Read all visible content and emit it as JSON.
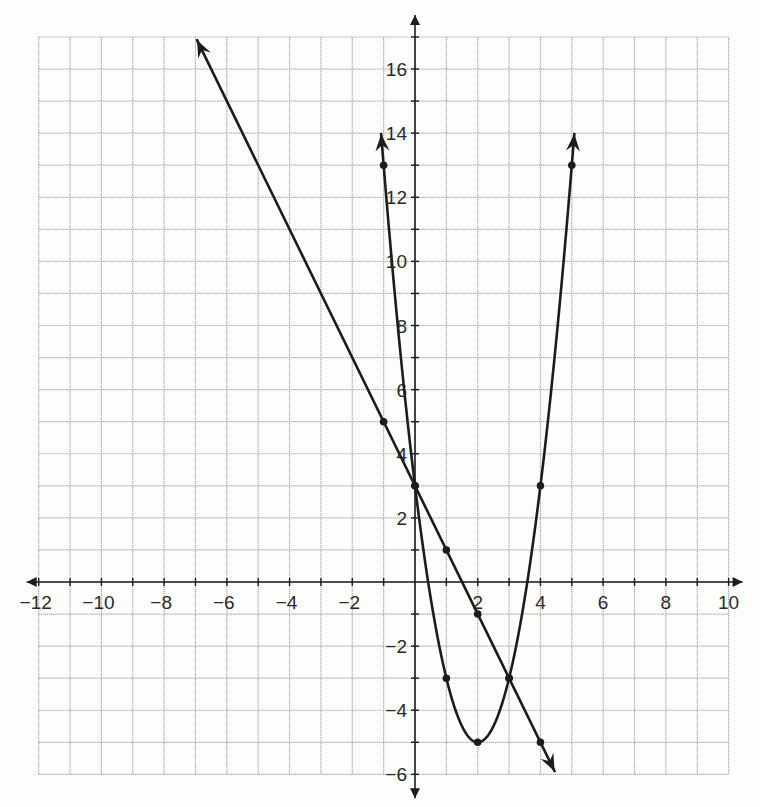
{
  "chart_data": {
    "type": "line",
    "title": "",
    "xlabel": "",
    "ylabel": "",
    "xlim": [
      -12,
      10
    ],
    "ylim": [
      -6,
      17
    ],
    "grid": true,
    "x_ticks": [
      -12,
      -10,
      -8,
      -6,
      -4,
      -2,
      2,
      4,
      6,
      8,
      10
    ],
    "y_ticks": [
      -6,
      -4,
      -2,
      2,
      4,
      6,
      8,
      10,
      12,
      14,
      16
    ],
    "x_tick_labels": [
      "−12",
      "−10",
      "−8",
      "−6",
      "−4",
      "−2",
      "2",
      "4",
      "6",
      "8",
      "10"
    ],
    "y_tick_labels": [
      "−6",
      "−4",
      "−2",
      "2",
      "4",
      "6",
      "8",
      "10",
      "12",
      "14",
      "16"
    ],
    "series": [
      {
        "name": "parabola",
        "equation": "y = 2x^2 - 8x + 3",
        "kind": "curve",
        "points": [
          [
            -1,
            13
          ],
          [
            0,
            3
          ],
          [
            1,
            -3
          ],
          [
            2,
            -5
          ],
          [
            3,
            -3
          ],
          [
            4,
            3
          ],
          [
            5,
            13
          ]
        ],
        "arrow_ends": [
          [
            -1.08,
            16.9
          ],
          [
            5.08,
            16.9
          ]
        ]
      },
      {
        "name": "line",
        "equation": "y = -2x + 3",
        "kind": "line",
        "points": [
          [
            -1,
            5
          ],
          [
            0,
            3
          ],
          [
            1,
            1
          ],
          [
            2,
            -1
          ],
          [
            3,
            -3
          ],
          [
            4,
            -5
          ]
        ],
        "arrow_ends": [
          [
            -6.95,
            16.9
          ],
          [
            4.45,
            -5.9
          ]
        ]
      }
    ],
    "intersections": [
      [
        0,
        3
      ],
      [
        3,
        -3
      ]
    ]
  },
  "layout": {
    "x0_px": 415,
    "y0_px": 582,
    "px_per_x": 31.36,
    "px_per_y": 32.06,
    "colors": {
      "ink": "#1c1c1c",
      "grid": "#a9a9a9",
      "paper": "#fdfdfc"
    }
  }
}
